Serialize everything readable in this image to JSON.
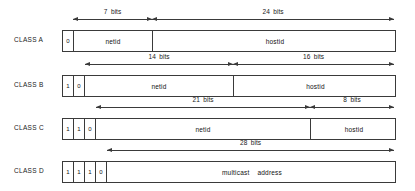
{
  "diagram": {
    "rows": [
      {
        "label": "CLASS A",
        "label_x": 14,
        "label_y": 36,
        "box": {
          "x": 62,
          "y": 30,
          "w": 334,
          "h": 22
        },
        "bits": [
          {
            "value": "0",
            "x": 0,
            "w": 11
          }
        ],
        "fields": [
          {
            "text": "netid",
            "x": 11,
            "w": 79,
            "divider": true
          },
          {
            "text": "hostid",
            "x": 90,
            "w": 244,
            "divider": false
          }
        ],
        "dims": [
          {
            "text": "7  bits",
            "x1": 73,
            "x2": 152,
            "y": 19,
            "label_y": 8
          },
          {
            "text": "24  bits",
            "x1": 152,
            "x2": 394,
            "y": 19,
            "label_y": 8
          }
        ]
      },
      {
        "label": "CLASS B",
        "label_x": 14,
        "label_y": 81,
        "box": {
          "x": 62,
          "y": 75,
          "w": 334,
          "h": 22
        },
        "bits": [
          {
            "value": "1",
            "x": 0,
            "w": 11
          },
          {
            "value": "0",
            "x": 11,
            "w": 11
          }
        ],
        "fields": [
          {
            "text": "netid",
            "x": 22,
            "w": 149,
            "divider": true
          },
          {
            "text": "hostid",
            "x": 171,
            "w": 163,
            "divider": false
          }
        ],
        "dims": [
          {
            "text": "14  bits",
            "x1": 85,
            "x2": 233,
            "y": 64,
            "label_y": 53
          },
          {
            "text": "16  bits",
            "x1": 233,
            "x2": 394,
            "y": 64,
            "label_y": 53
          }
        ]
      },
      {
        "label": "CLASS C",
        "label_x": 14,
        "label_y": 124,
        "box": {
          "x": 62,
          "y": 118,
          "w": 334,
          "h": 22
        },
        "bits": [
          {
            "value": "1",
            "x": 0,
            "w": 11
          },
          {
            "value": "1",
            "x": 11,
            "w": 11
          },
          {
            "value": "0",
            "x": 22,
            "w": 11
          }
        ],
        "fields": [
          {
            "text": "netid",
            "x": 33,
            "w": 215,
            "divider": true
          },
          {
            "text": "hostid",
            "x": 248,
            "w": 86,
            "divider": false
          }
        ],
        "dims": [
          {
            "text": "21  bits",
            "x1": 96,
            "x2": 310,
            "y": 107,
            "label_y": 96
          },
          {
            "text": "8  bits",
            "x1": 310,
            "x2": 394,
            "y": 107,
            "label_y": 96
          }
        ]
      },
      {
        "label": "CLASS D",
        "label_x": 14,
        "label_y": 167,
        "box": {
          "x": 62,
          "y": 161,
          "w": 334,
          "h": 22
        },
        "bits": [
          {
            "value": "1",
            "x": 0,
            "w": 11
          },
          {
            "value": "1",
            "x": 11,
            "w": 11
          },
          {
            "value": "1",
            "x": 22,
            "w": 11
          },
          {
            "value": "0",
            "x": 33,
            "w": 11
          }
        ],
        "fields": [
          {
            "text": "multicast    address",
            "x": 44,
            "w": 290,
            "divider": false
          }
        ],
        "dims": [
          {
            "text": "28  bits",
            "x1": 107,
            "x2": 394,
            "y": 150,
            "label_y": 139
          }
        ]
      }
    ]
  }
}
